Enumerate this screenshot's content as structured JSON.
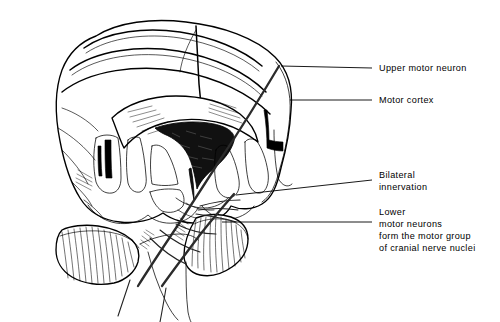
{
  "figure": {
    "background_color": "#ffffff",
    "ink_color": "#000000",
    "ventricle_fill": "#111111",
    "tract_color": "#2b2b2b"
  },
  "labels": [
    {
      "id": "upper-motor-neuron",
      "lines": [
        "Upper motor neuron"
      ],
      "text_x": 379,
      "text_y": 71,
      "leader": {
        "x1": 281,
        "y1": 66,
        "x2": 372,
        "y2": 68
      }
    },
    {
      "id": "motor-cortex",
      "lines": [
        "Motor cortex"
      ],
      "text_x": 379,
      "text_y": 103,
      "leader": {
        "x1": 290,
        "y1": 100,
        "x2": 372,
        "y2": 100
      }
    },
    {
      "id": "bilateral-innervation",
      "lines": [
        "Bilateral",
        "innervation"
      ],
      "text_x": 379,
      "text_y": 178,
      "leader": {
        "x1": 236,
        "y1": 195,
        "x2": 372,
        "y2": 180
      }
    },
    {
      "id": "lower-motor-neurons",
      "lines": [
        "Lower",
        "motor neurons",
        "form the motor group",
        "of cranial nerve nuclei"
      ],
      "text_x": 379,
      "text_y": 215,
      "leader": {
        "x1": 222,
        "y1": 222,
        "x2": 372,
        "y2": 222
      }
    }
  ],
  "anatomy": {
    "parts": [
      {
        "name": "cerebral-hemispheres",
        "description": "Coronal section of cerebrum with gyri and sulci"
      },
      {
        "name": "lateral-ventricles",
        "description": "Dark filled ventricular cavity at center"
      },
      {
        "name": "corpus-callosum",
        "description": "Arching white matter band above ventricle"
      },
      {
        "name": "left-cerebellum",
        "description": "Striated folia, lower left"
      },
      {
        "name": "right-cerebellum",
        "description": "Striated folia, lower center-right"
      },
      {
        "name": "corticospinal-tract",
        "description": "Shaded descending motor tract from cortex"
      },
      {
        "name": "decussation",
        "description": "Crossing fibers of the pyramidal tracts"
      },
      {
        "name": "brainstem",
        "description": "Descending stem below cerebellum"
      }
    ]
  }
}
